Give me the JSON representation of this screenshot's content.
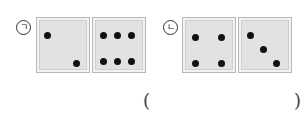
{
  "items": [
    {
      "label": "ㄱ",
      "tiles": [
        {
          "pips": 2,
          "dots": [
            [
              10,
              17
            ],
            [
              39,
              45
            ]
          ]
        },
        {
          "pips": 6,
          "dots": [
            [
              10,
              17
            ],
            [
              24,
              17
            ],
            [
              38,
              17
            ],
            [
              10,
              43
            ],
            [
              24,
              43
            ],
            [
              38,
              43
            ]
          ]
        }
      ]
    },
    {
      "label": "ㄴ",
      "tiles": [
        {
          "pips": 4,
          "dots": [
            [
              12,
              19
            ],
            [
              38,
              19
            ],
            [
              12,
              45
            ],
            [
              38,
              45
            ]
          ]
        },
        {
          "pips": 3,
          "dots": [
            [
              11,
              17
            ],
            [
              24,
              31
            ],
            [
              37,
              45
            ]
          ]
        }
      ]
    }
  ],
  "answer": {
    "open": "(",
    "close": ")",
    "value": ""
  }
}
